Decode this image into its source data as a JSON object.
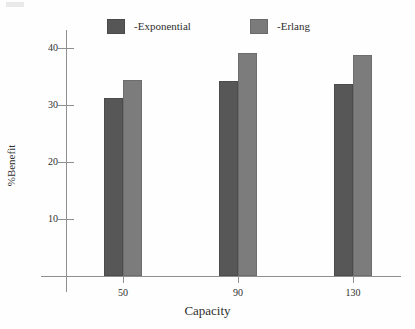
{
  "chart_data": {
    "type": "bar",
    "title": "",
    "xlabel": "Capacity",
    "ylabel": "%Benefit",
    "categories": [
      "50",
      "90",
      "130"
    ],
    "series": [
      {
        "name": "-Exponential",
        "color": "#575757",
        "values": [
          31.2,
          34.3,
          33.6
        ]
      },
      {
        "name": "-Erlang",
        "color": "#7c7c7c",
        "values": [
          34.4,
          39.2,
          38.7
        ]
      }
    ],
    "ylim": [
      0,
      44
    ],
    "yticks": [
      10,
      20,
      30,
      40
    ],
    "ytick_labels": [
      "10",
      "20",
      "30",
      "40"
    ],
    "grid": false,
    "legend_position": "top"
  },
  "legend": {
    "items": [
      {
        "label": "-Exponential",
        "swatch": "legend-swatch-exponential"
      },
      {
        "label": "-Erlang",
        "swatch": "legend-swatch-erlang"
      }
    ]
  },
  "axes": {
    "y_title": "%Benefit",
    "x_title": "Capacity"
  }
}
